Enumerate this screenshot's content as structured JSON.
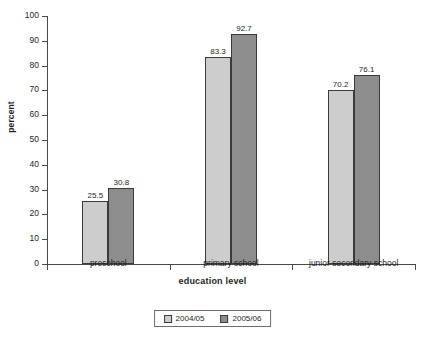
{
  "chart_data": {
    "type": "bar",
    "title": "",
    "subtitle": "",
    "xlabel": "education level",
    "ylabel": "percent",
    "categories": [
      "preschool",
      "primary school",
      "junior secondary school"
    ],
    "series": [
      {
        "name": "2004/05",
        "color": "#cdcdcd",
        "values": [
          25.5,
          83.3,
          70.2
        ]
      },
      {
        "name": "2005/06",
        "color": "#8d8d8d",
        "values": [
          30.8,
          92.7,
          76.1
        ]
      }
    ],
    "ylim": [
      0,
      100
    ],
    "ytick_step": 10,
    "yticks": [
      0,
      10,
      20,
      30,
      40,
      50,
      60,
      70,
      80,
      90,
      100
    ],
    "ytick_labels": [
      "0",
      "10",
      "20",
      "30",
      "40",
      "50",
      "60",
      "70",
      "80",
      "90",
      "100"
    ],
    "grid": false,
    "legend_position": "bottom-center",
    "data_labels": true,
    "data_label_values": [
      [
        "25.5",
        "30.8"
      ],
      [
        "83.3",
        "92.7"
      ],
      [
        "70.2",
        "76.1"
      ]
    ],
    "background": "#ffffff",
    "axis_color": "#4a4a4a"
  }
}
